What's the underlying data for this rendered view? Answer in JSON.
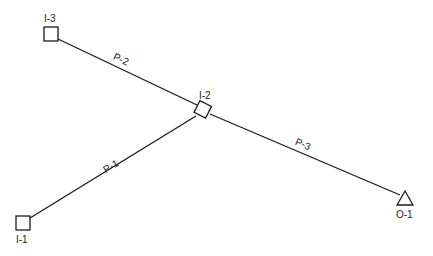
{
  "diagram": {
    "nodes": [
      {
        "id": "I-3",
        "label": "I-3",
        "shape": "square",
        "x": 51,
        "y": 34
      },
      {
        "id": "I-2",
        "label": "I-2",
        "shape": "square-rotated",
        "x": 203,
        "y": 110
      },
      {
        "id": "I-1",
        "label": "I-1",
        "shape": "square",
        "x": 23,
        "y": 223
      },
      {
        "id": "O-1",
        "label": "O-1",
        "shape": "triangle",
        "x": 405,
        "y": 199
      }
    ],
    "pipes": [
      {
        "id": "P-2",
        "label": "P-2",
        "from": "I-3",
        "to": "I-2"
      },
      {
        "id": "P-1",
        "label": "P-1",
        "from": "I-1",
        "to": "I-2"
      },
      {
        "id": "P-3",
        "label": "P-3",
        "from": "I-2",
        "to": "O-1"
      }
    ],
    "colors": {
      "line": "#1a1a1a",
      "text": "#222222",
      "background": "#ffffff"
    }
  }
}
